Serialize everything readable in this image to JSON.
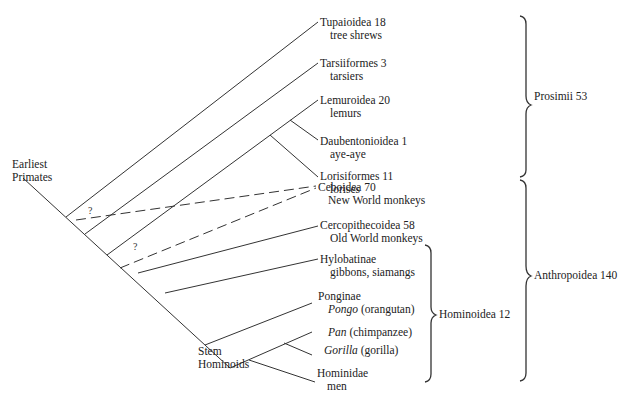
{
  "diagram": {
    "type": "phylogenetic-tree",
    "root_label": [
      "Earliest",
      "Primates"
    ],
    "stem_label": [
      "Stem",
      "Hominoids"
    ],
    "uncertain_mark": "?",
    "taxa": [
      {
        "name": "Tupaioidea 18",
        "common": "tree shrews"
      },
      {
        "name": "Tarsiiformes 3",
        "common": "tarsiers"
      },
      {
        "name": "Lemuroidea 20",
        "common": "lemurs"
      },
      {
        "name": "Daubentonioidea 1",
        "common": "aye-aye"
      },
      {
        "name": "Lorisiformes 11",
        "common": "lorises"
      },
      {
        "name": "Ceboidea 70",
        "common": "New World monkeys"
      },
      {
        "name": "Cercopithecoidea 58",
        "common": "Old World monkeys"
      },
      {
        "name": "Hylobatinae",
        "common": "gibbons, siamangs"
      },
      {
        "name": "Ponginae",
        "genus": "Pongo",
        "common": "(orangutan)"
      },
      {
        "name": "",
        "genus": "Pan",
        "common": "(chimpanzee)"
      },
      {
        "name": "",
        "genus": "Gorilla",
        "common": "(gorilla)"
      },
      {
        "name": "Hominidae",
        "common": "men"
      }
    ],
    "groups": [
      {
        "label": "Prosimii 53"
      },
      {
        "label": "Anthropoidea 140"
      },
      {
        "label": "Hominoidea 12"
      }
    ]
  }
}
